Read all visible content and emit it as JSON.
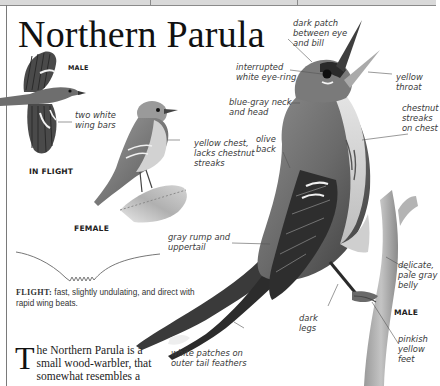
{
  "page": {
    "title": "Northern Parula",
    "header_band_dividers": [
      150,
      297
    ]
  },
  "flight_bird": {
    "sex_label": "MALE",
    "view_label": "IN FLIGHT",
    "callout": "two white wing bars"
  },
  "female_bird": {
    "sex_label": "FEMALE",
    "callout": "yellow chest, lacks chestnut streaks"
  },
  "male_bird": {
    "sex_label": "MALE",
    "callouts": {
      "dark_patch": "dark patch between eye and bill",
      "eye_ring": "interrupted white eye-ring",
      "throat": "yellow throat",
      "neck": "blue-gray neck and head",
      "chest": "chestnut streaks on chest",
      "back": "olive back",
      "rump": "gray rump and uppertail",
      "belly": "delicate, pale gray belly",
      "legs": "dark legs",
      "feet": "pinkish yellow feet",
      "tail": "white patches on outer tail feathers"
    }
  },
  "flight_description": {
    "key": "FLIGHT:",
    "text": "fast, slightly undulating, and direct with rapid wing beats."
  },
  "body_text": {
    "dropcap": "T",
    "lines": "he Northern Parula is a small wood-warbler, that somewhat resembles a"
  },
  "colors": {
    "page_bg": "#ffffff",
    "header_band": "#d9d9d9",
    "rule": "#7a7a7a",
    "text": "#222222",
    "label_text": "#3a3a3a"
  }
}
